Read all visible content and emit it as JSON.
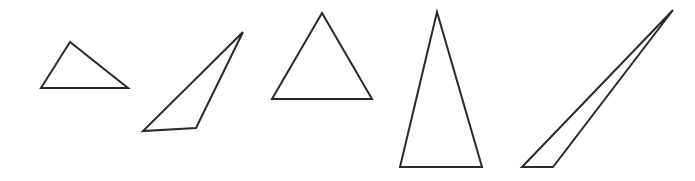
{
  "figure": {
    "canvas": {
      "width": 695,
      "height": 181
    },
    "background_color": "#ffffff",
    "stroke_color": "#2a2a2a",
    "stroke_width": 2,
    "fill": "none",
    "shape_count": 5,
    "shapes": [
      {
        "id": "triangle-1",
        "name": "obtuse-scalene-triangle",
        "description": "Low wide triangle with apex left of center",
        "points": "70,42 41,88 128,88",
        "vertices": [
          [
            70,
            42
          ],
          [
            41,
            88
          ],
          [
            128,
            88
          ]
        ]
      },
      {
        "id": "triangle-2",
        "name": "thin-oblique-triangle",
        "description": "Narrow slanted triangle leaning up to the right",
        "points": "243,32 143,131 196,128",
        "vertices": [
          [
            243,
            32
          ],
          [
            143,
            131
          ],
          [
            196,
            128
          ]
        ]
      },
      {
        "id": "triangle-3",
        "name": "equilateral-triangle",
        "description": "Near-equilateral upright triangle",
        "points": "322,13 272,99 372,99",
        "vertices": [
          [
            322,
            13
          ],
          [
            272,
            99
          ],
          [
            372,
            99
          ]
        ]
      },
      {
        "id": "triangle-4",
        "name": "tall-isosceles-triangle",
        "description": "Tall narrow isosceles triangle",
        "points": "437,12 400,167 482,167",
        "vertices": [
          [
            437,
            12
          ],
          [
            400,
            167
          ],
          [
            482,
            167
          ]
        ]
      },
      {
        "id": "triangle-5",
        "name": "sliver-triangle",
        "description": "Very thin sliver triangle rising to the upper right",
        "points": "673,10 522,167 553,167",
        "vertices": [
          [
            673,
            10
          ],
          [
            522,
            167
          ],
          [
            553,
            167
          ]
        ]
      }
    ]
  }
}
